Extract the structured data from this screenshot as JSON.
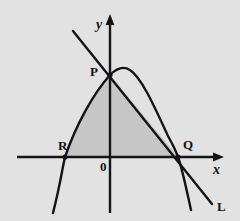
{
  "figure": {
    "background_color": "#e2e2e2",
    "stroke_color": "#141414",
    "shade_color": "#c6c6c6",
    "labels": {
      "point_p": "P",
      "point_q": "Q",
      "point_r": "R",
      "origin": "0",
      "axis_x": "x",
      "axis_y": "y",
      "line_l": "L"
    },
    "geometry": {
      "origin_px": [
        110,
        157
      ],
      "x_axis": {
        "start_px": [
          17,
          157
        ],
        "end_px": [
          222,
          157
        ],
        "arrow": "right"
      },
      "y_axis": {
        "start_px": [
          110,
          213
        ],
        "end_px": [
          110,
          15
        ],
        "arrow": "up"
      },
      "parabola": {
        "vertex_px": [
          126,
          69
        ],
        "y_intercept_px": [
          110,
          75
        ],
        "x_intercepts_px": [
          [
            65,
            157
          ],
          [
            178,
            157
          ]
        ],
        "left_end_px": [
          53,
          213
        ],
        "right_end_px": [
          191,
          210
        ],
        "opens": "down"
      },
      "line_l": {
        "through_px": [
          [
            110,
            75
          ],
          [
            178,
            157
          ]
        ],
        "start_px": [
          73,
          31
        ],
        "end_px": [
          212,
          204
        ],
        "slope_sign": "negative"
      },
      "shaded_region": {
        "description": "bounded by parabola arc R to P, segment P to Q, and x-axis segment Q to R",
        "vertices_px": [
          [
            65,
            157
          ],
          [
            110,
            75
          ],
          [
            178,
            157
          ]
        ]
      }
    }
  }
}
